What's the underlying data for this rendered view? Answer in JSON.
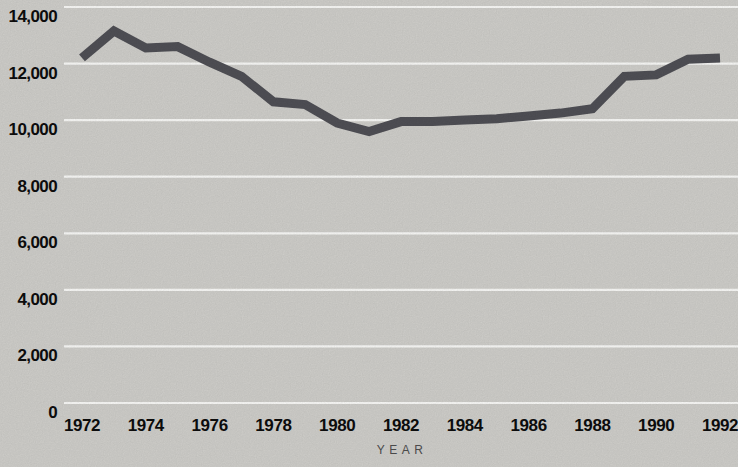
{
  "chart_data": {
    "type": "line",
    "title": "",
    "xlabel": "YEAR",
    "ylabel": "",
    "x": [
      1972,
      1973,
      1974,
      1975,
      1976,
      1977,
      1978,
      1979,
      1980,
      1981,
      1982,
      1983,
      1984,
      1985,
      1986,
      1987,
      1988,
      1989,
      1990,
      1991,
      1992
    ],
    "series": [
      {
        "name": "value",
        "values": [
          12200,
          13150,
          12550,
          12600,
          12050,
          11550,
          10650,
          10550,
          9900,
          9600,
          9950,
          9950,
          10000,
          10050,
          10150,
          10250,
          10400,
          11550,
          11600,
          12150,
          12200
        ]
      }
    ],
    "xlim": [
      1972,
      1992
    ],
    "ylim": [
      0,
      14000
    ],
    "xticks": {
      "values": [
        1972,
        1974,
        1976,
        1978,
        1980,
        1982,
        1984,
        1986,
        1988,
        1990,
        1992
      ],
      "labels": [
        "1972",
        "1974",
        "1976",
        "1978",
        "1980",
        "1982",
        "1984",
        "1986",
        "1988",
        "1990",
        "1992"
      ]
    },
    "yticks": {
      "values": [
        0,
        2000,
        4000,
        6000,
        8000,
        10000,
        12000,
        14000
      ],
      "labels": [
        "0",
        "2,000",
        "4,000",
        "6,000",
        "8,000",
        "10,000",
        "12,000",
        "14,000"
      ]
    },
    "grid": "horizontal",
    "legend": "none",
    "colors": {
      "background": "#d3d2ce",
      "gridline": "#fdfdfb",
      "line": "#515157",
      "tick_label": "#0d0d0d",
      "axis_title": "#4a4a4a"
    }
  }
}
